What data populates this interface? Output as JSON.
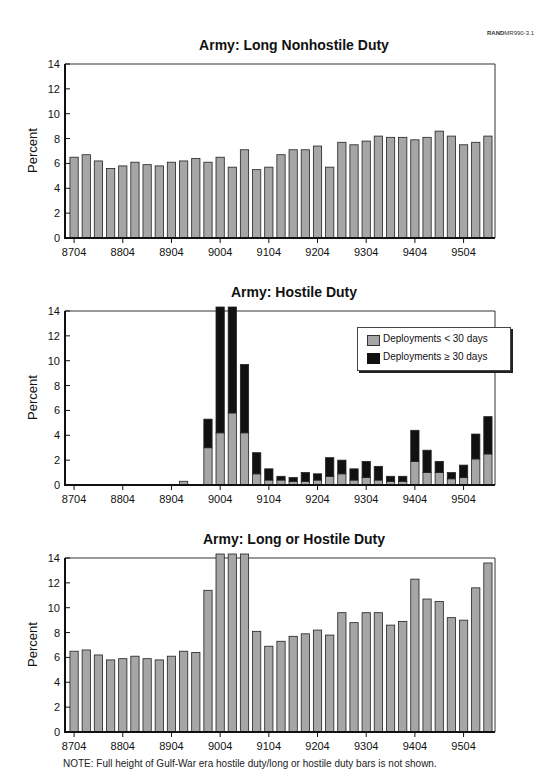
{
  "figure_ref": {
    "bold": "RAND",
    "rest": "MR990-3.1"
  },
  "note": "NOTE:  Full height of Gulf-War era hostile duty/long or hostile duty bars is not shown.",
  "colors": {
    "gray_bar": "#a6a6a6",
    "black_bar": "#111111",
    "axis": "#111111"
  },
  "chart_data": [
    {
      "type": "bar",
      "title": "Army:  Long Nonhostile Duty",
      "xlabel": "",
      "ylabel": "Percent",
      "ylim": [
        0,
        14
      ],
      "yticks": [
        0,
        2,
        4,
        6,
        8,
        10,
        12,
        14
      ],
      "xtick_labels": [
        "8704",
        "8804",
        "8904",
        "9004",
        "9104",
        "9204",
        "9304",
        "9404",
        "9504"
      ],
      "categories": [
        "8704",
        "8707",
        "8710",
        "8801",
        "8804",
        "8807",
        "8810",
        "8901",
        "8904",
        "8907",
        "8910",
        "9001",
        "9004",
        "9007",
        "9010",
        "9101",
        "9104",
        "9107",
        "9110",
        "9201",
        "9204",
        "9207",
        "9210",
        "9301",
        "9304",
        "9307",
        "9310",
        "9401",
        "9404",
        "9407",
        "9410",
        "9501",
        "9504",
        "9507",
        "9510"
      ],
      "values": [
        6.5,
        6.7,
        6.2,
        5.6,
        5.8,
        6.1,
        5.9,
        5.8,
        6.1,
        6.2,
        6.4,
        6.1,
        6.5,
        5.7,
        7.1,
        5.5,
        5.7,
        6.7,
        7.1,
        7.1,
        7.4,
        5.7,
        7.7,
        7.5,
        7.8,
        8.2,
        8.1,
        8.1,
        7.9,
        8.1,
        8.6,
        8.2,
        7.5,
        7.7,
        8.2
      ],
      "grid": false
    },
    {
      "type": "bar",
      "stacked": true,
      "title": "Army:  Hostile Duty",
      "xlabel": "",
      "ylabel": "Percent",
      "ylim": [
        0,
        14
      ],
      "yticks": [
        0,
        2,
        4,
        6,
        8,
        10,
        12,
        14
      ],
      "xtick_labels": [
        "8704",
        "8804",
        "8904",
        "9004",
        "9104",
        "9204",
        "9304",
        "9404",
        "9504"
      ],
      "categories": [
        "8704",
        "8707",
        "8710",
        "8801",
        "8804",
        "8807",
        "8810",
        "8901",
        "8904",
        "8907",
        "8910",
        "9001",
        "9004",
        "9007",
        "9010",
        "9101",
        "9104",
        "9107",
        "9110",
        "9201",
        "9204",
        "9207",
        "9210",
        "9301",
        "9304",
        "9307",
        "9310",
        "9401",
        "9404",
        "9407",
        "9410",
        "9501",
        "9504",
        "9507",
        "9510"
      ],
      "legend": {
        "position": "upper right",
        "entries": [
          "Deployments < 30 days",
          "Deployments ≥ 30 days"
        ]
      },
      "series": [
        {
          "name": "Deployments < 30 days",
          "color": "#a6a6a6",
          "values": [
            0,
            0,
            0,
            0,
            0,
            0,
            0,
            0,
            0,
            0.3,
            0,
            3.0,
            4.2,
            5.8,
            4.2,
            0.9,
            0.4,
            0.4,
            0.3,
            0.3,
            0.4,
            0.7,
            0.9,
            0.4,
            0.6,
            0.4,
            0.3,
            0.3,
            1.9,
            1.0,
            1.0,
            0.5,
            0.6,
            2.1,
            2.5
          ]
        },
        {
          "name": "Deployments ≥ 30 days",
          "color": "#111111",
          "values": [
            0,
            0,
            0,
            0,
            0,
            0,
            0,
            0,
            0,
            0,
            0,
            2.3,
            10.2,
            8.6,
            5.5,
            1.7,
            0.9,
            0.3,
            0.3,
            0.7,
            0.5,
            1.5,
            1.1,
            0.9,
            1.3,
            1.1,
            0.4,
            0.4,
            2.5,
            1.8,
            0.9,
            0.5,
            1.0,
            2.0,
            3.0
          ]
        }
      ],
      "annotation": "Bars at 9004 and 9007 exceed 14 (truncated)",
      "grid": false
    },
    {
      "type": "bar",
      "title": "Army:  Long or Hostile Duty",
      "xlabel": "",
      "ylabel": "Percent",
      "ylim": [
        0,
        14
      ],
      "yticks": [
        0,
        2,
        4,
        6,
        8,
        10,
        12,
        14
      ],
      "xtick_labels": [
        "8704",
        "8804",
        "8904",
        "9004",
        "9104",
        "9204",
        "9304",
        "9404",
        "9504"
      ],
      "categories": [
        "8704",
        "8707",
        "8710",
        "8801",
        "8804",
        "8807",
        "8810",
        "8901",
        "8904",
        "8907",
        "8910",
        "9001",
        "9004",
        "9007",
        "9010",
        "9101",
        "9104",
        "9107",
        "9110",
        "9201",
        "9204",
        "9207",
        "9210",
        "9301",
        "9304",
        "9307",
        "9310",
        "9401",
        "9404",
        "9407",
        "9410",
        "9501",
        "9504",
        "9507",
        "9510"
      ],
      "values": [
        6.5,
        6.6,
        6.2,
        5.8,
        5.9,
        6.1,
        5.9,
        5.8,
        6.1,
        6.5,
        6.4,
        11.4,
        14.4,
        14.4,
        14.4,
        8.1,
        6.9,
        7.3,
        7.7,
        7.9,
        8.2,
        7.8,
        9.6,
        8.8,
        9.6,
        9.6,
        8.6,
        8.9,
        12.3,
        10.7,
        10.5,
        9.2,
        9.0,
        11.6,
        13.6
      ],
      "annotation": "Bars at 9004, 9007, 9010 exceed 14 (truncated)",
      "grid": false
    }
  ]
}
